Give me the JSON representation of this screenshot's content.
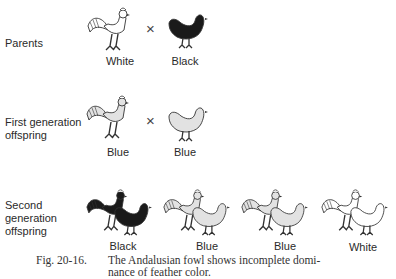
{
  "rows": {
    "parents": {
      "label": "Parents",
      "cross_symbol": "×",
      "birds": [
        {
          "type": "rooster",
          "color_name": "White",
          "fill": "#ffffff"
        },
        {
          "type": "hen",
          "color_name": "Black",
          "fill": "#1a1a1a"
        }
      ]
    },
    "first_generation": {
      "label_line1": "First generation",
      "label_line2": "offspring",
      "cross_symbol": "×",
      "birds": [
        {
          "type": "rooster",
          "color_name": "Blue",
          "fill": "#e2e2e2"
        },
        {
          "type": "hen",
          "color_name": "Blue",
          "fill": "#e2e2e2"
        }
      ]
    },
    "second_generation": {
      "label_line1": "Second",
      "label_line2": "generation",
      "label_line3": "offspring",
      "pairs": [
        {
          "color_name": "Black",
          "fill": "#1a1a1a"
        },
        {
          "color_name": "Blue",
          "fill": "#e2e2e2"
        },
        {
          "color_name": "Blue",
          "fill": "#e2e2e2"
        },
        {
          "color_name": "White",
          "fill": "#ffffff"
        }
      ]
    }
  },
  "caption": {
    "figure_number": "Fig. 20-16.",
    "line1": "The Andalusian fowl shows incomplete domi-",
    "line2": "nance of feather color."
  }
}
